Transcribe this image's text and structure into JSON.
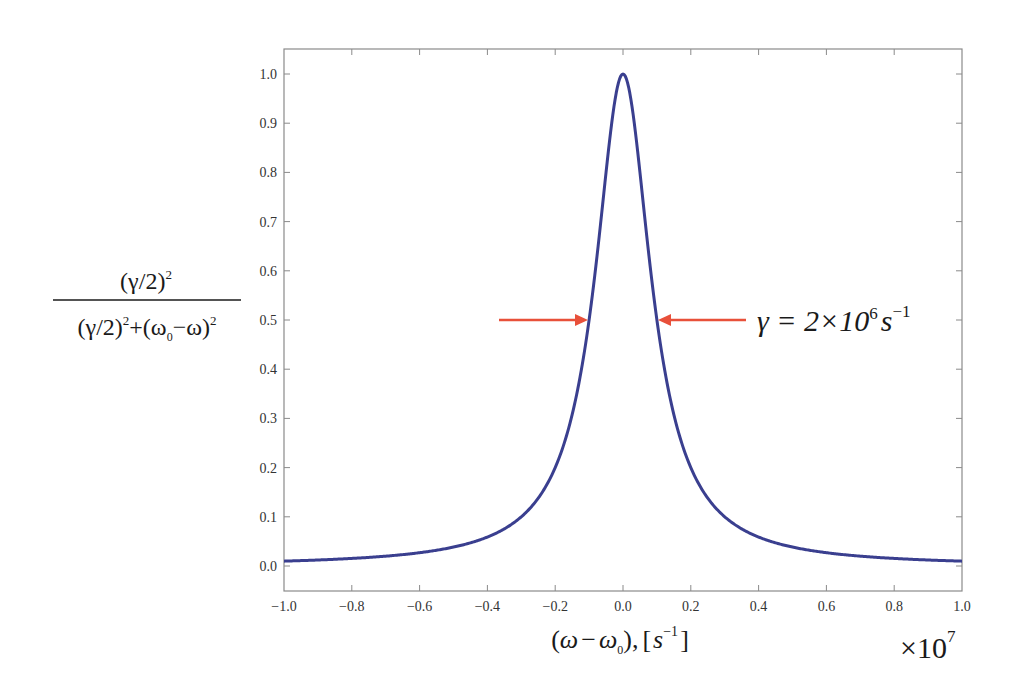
{
  "chart_data": {
    "type": "line",
    "title": "",
    "xlabel": "(ω − ω0), [s^-1]",
    "xlabel_parts": {
      "open": "(",
      "w": "ω",
      "minus": "−",
      "w0": "ω",
      "sub0": "0",
      "close": "),",
      "lb": "[",
      "s": "s",
      "sup": "−1",
      "rb": "]"
    },
    "x_multiplier": "×10",
    "x_multiplier_exp": "7",
    "ylabel": "(γ/2)^2 / ((γ/2)^2 + (ω0 − ω)^2)",
    "ylabel_parts": {
      "num": "(γ/2)",
      "num_sup": "2",
      "den_a": "(γ/2)",
      "den_a_sup": "2",
      "den_plus": "+",
      "den_b_open": "(ω",
      "den_b_sub": "0",
      "den_b_rest": "−ω)",
      "den_b_sup": "2"
    },
    "annotation": {
      "text_gamma": "γ = 2×10",
      "exp": "6",
      "unit": "s",
      "unit_exp": "−1",
      "arrow_color": "#e8503a",
      "y_level": 0.5
    },
    "xlim": [
      -1.0,
      1.0
    ],
    "ylim": [
      -0.05,
      1.05
    ],
    "xticks": [
      -1.0,
      -0.8,
      -0.6,
      -0.4,
      -0.2,
      0.0,
      0.2,
      0.4,
      0.6,
      0.8,
      1.0
    ],
    "xtick_labels": [
      "−1.0",
      "−0.8",
      "−0.6",
      "−0.4",
      "−0.2",
      "0.0",
      "0.2",
      "0.4",
      "0.6",
      "0.8",
      "1.0"
    ],
    "yticks": [
      0.0,
      0.1,
      0.2,
      0.3,
      0.4,
      0.5,
      0.6,
      0.7,
      0.8,
      0.9,
      1.0
    ],
    "ytick_labels": [
      "0.0",
      "0.1",
      "0.2",
      "0.3",
      "0.4",
      "0.5",
      "0.6",
      "0.7",
      "0.8",
      "0.9",
      "1.0"
    ],
    "grid": false,
    "legend": null,
    "series": [
      {
        "name": "Lorentzian",
        "color": "#3a3f8f",
        "function": "1/(1+(x/0.1)^2)",
        "x": [
          -1.0,
          -0.8,
          -0.6,
          -0.4,
          -0.3,
          -0.2,
          -0.15,
          -0.1,
          -0.05,
          0.0,
          0.05,
          0.1,
          0.15,
          0.2,
          0.3,
          0.4,
          0.6,
          0.8,
          1.0
        ],
        "y": [
          0.0099,
          0.0154,
          0.027,
          0.0588,
          0.1,
          0.2,
          0.3077,
          0.5,
          0.8,
          1.0,
          0.8,
          0.5,
          0.3077,
          0.2,
          0.1,
          0.0588,
          0.027,
          0.0154,
          0.0099
        ]
      }
    ]
  }
}
